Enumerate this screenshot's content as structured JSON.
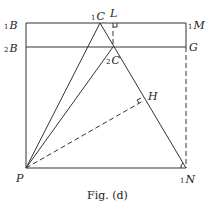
{
  "figure": {
    "caption": "Fig. (d)",
    "points": {
      "B1": {
        "label": "B",
        "sub": "1"
      },
      "B2": {
        "label": "B",
        "sub": "2"
      },
      "C1": {
        "label": "C",
        "sub": "1"
      },
      "C2": {
        "label": "C",
        "sub": "2"
      },
      "L": {
        "label": "L"
      },
      "M1": {
        "label": "M",
        "sub": "1"
      },
      "G": {
        "label": "G"
      },
      "H": {
        "label": "H"
      },
      "P": {
        "label": "P"
      },
      "N1": {
        "label": "N",
        "sub": "1"
      }
    }
  }
}
